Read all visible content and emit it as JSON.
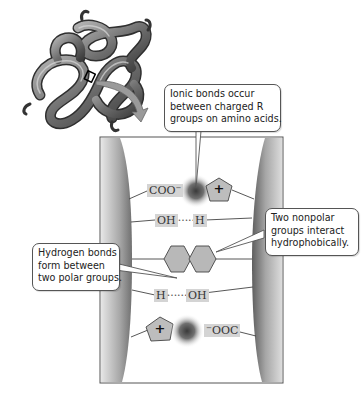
{
  "diagram": {
    "protein_illustration": "folded-protein-ribbon",
    "callouts": {
      "ionic": {
        "lines": [
          "Ionic bonds occur",
          "between charged R",
          "groups on amino acids."
        ]
      },
      "hydrophobic": {
        "lines": [
          "Two nonpolar",
          "groups interact",
          "hydrophobically."
        ]
      },
      "hydrogen": {
        "lines": [
          "Hydrogen bonds",
          "form between",
          "two polar groups."
        ]
      }
    },
    "interactions": {
      "ionic_top": {
        "left_label": "COO",
        "left_charge": "−",
        "right_symbol": "+"
      },
      "hbond_top": {
        "left_label": "OH",
        "dots": "••••••",
        "right_label": "H"
      },
      "hydrophobic": {
        "shape": "two-hexagons"
      },
      "hbond_bottom": {
        "left_label": "H",
        "dots": "•••••••",
        "right_label": "OH"
      },
      "ionic_bottom": {
        "left_symbol": "+",
        "right_charge": "−",
        "right_label": "OOC"
      }
    },
    "colors": {
      "backbone_gray": "#8a8a8a",
      "box_border": "#555555",
      "label_bg": "#d4d4d4",
      "shape_fill": "#b8b8b8",
      "arrow_fill": "#9a9a9a"
    }
  }
}
